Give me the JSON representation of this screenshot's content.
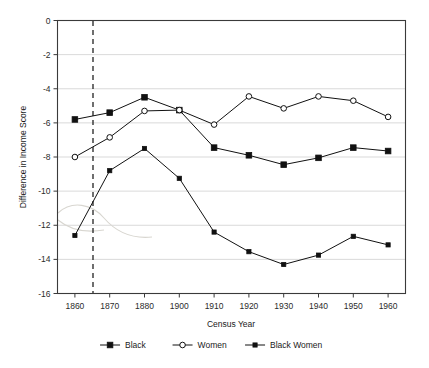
{
  "chart_data": {
    "type": "line",
    "title": "",
    "xlabel": "Census Year",
    "ylabel": "Difference in Income Score",
    "categories": [
      "1860",
      "1870",
      "1880",
      "1900",
      "1910",
      "1920",
      "1930",
      "1940",
      "1950",
      "1960"
    ],
    "x_tick_labels": [
      "1860",
      "1870",
      "1880",
      "1900",
      "1910",
      "1920",
      "1930",
      "1940",
      "1950",
      "1960"
    ],
    "y_tick_labels": [
      "0",
      "-2",
      "-4",
      "-6",
      "-8",
      "-10",
      "-12",
      "-14",
      "-16"
    ],
    "y_ticks": [
      0,
      -2,
      -4,
      -6,
      -8,
      -10,
      -12,
      -14,
      -16
    ],
    "ylim": [
      -16,
      0
    ],
    "grid": "horizontal",
    "legend_position": "bottom",
    "series": [
      {
        "name": "Black",
        "marker": "filled-square",
        "values": [
          -5.8,
          -5.4,
          -4.5,
          -5.25,
          -7.45,
          -7.9,
          -8.45,
          -8.05,
          -7.45,
          -7.65
        ]
      },
      {
        "name": "Women",
        "marker": "open-circle",
        "values": [
          -8.0,
          -6.85,
          -5.3,
          -5.25,
          -6.1,
          -4.45,
          -5.15,
          -4.45,
          -4.7,
          -5.65
        ]
      },
      {
        "name": "Black Women",
        "marker": "small-filled-square",
        "values": [
          -12.6,
          -8.8,
          -7.5,
          -9.25,
          -12.4,
          -13.55,
          -14.3,
          -13.75,
          -12.65,
          -13.15
        ]
      }
    ],
    "annotations": [
      {
        "name": "emancipation-marker",
        "type": "vertical-dashed-line",
        "x_position": 0.5,
        "label": ""
      }
    ],
    "colors": {
      "line": "#111111",
      "grid": "#c8c8c8",
      "frame": "#3a3a3a",
      "text": "#1a1a1a",
      "background": "#ffffff"
    }
  },
  "legend": {
    "items": [
      {
        "label": "Black",
        "marker": "filled-square"
      },
      {
        "label": "Women",
        "marker": "open-circle"
      },
      {
        "label": "Black Women",
        "marker": "small-filled-square"
      }
    ]
  }
}
